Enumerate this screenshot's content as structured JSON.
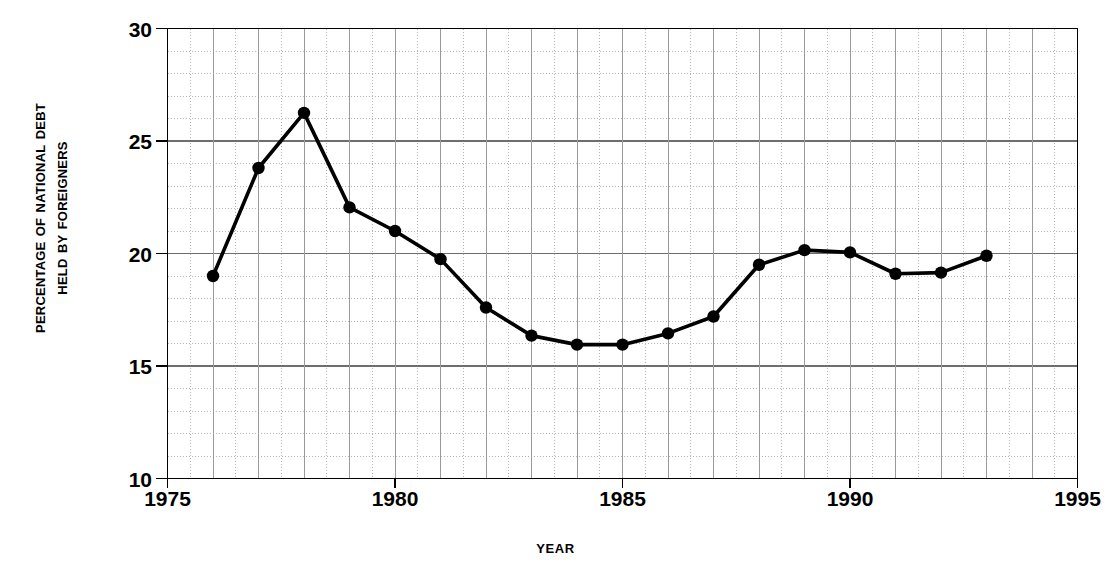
{
  "chart_data": {
    "type": "line",
    "title": "",
    "subtitle": "",
    "xlabel": "Year",
    "ylabel": "Percentage of National Debt Held by Foreigners",
    "ylabel_lines": [
      "Percentage of National Debt",
      "Held by Foreigners"
    ],
    "xlim": [
      1975,
      1995
    ],
    "ylim": [
      10,
      30
    ],
    "xticks": [
      1975,
      1980,
      1985,
      1990,
      1995
    ],
    "xtick_labels": [
      "1975",
      "1980",
      "1985",
      "1990",
      "1995"
    ],
    "yticks": [
      10,
      15,
      20,
      25,
      30
    ],
    "ytick_labels": [
      "10",
      "15",
      "20",
      "25",
      "30"
    ],
    "x_minor_step": 0.5,
    "y_minor_step": 1,
    "grid": true,
    "grid_major_color": "#808080",
    "grid_minor_color": "#b4b4b4",
    "legend": "none",
    "line_color": "#000000",
    "marker_color": "#000000",
    "marker": "circle",
    "x": [
      1976,
      1977,
      1978,
      1979,
      1980,
      1981,
      1982,
      1983,
      1984,
      1985,
      1986,
      1987,
      1988,
      1989,
      1990,
      1991,
      1992,
      1993
    ],
    "values": [
      19.0,
      23.8,
      26.25,
      22.05,
      21.0,
      19.75,
      17.6,
      16.35,
      15.95,
      15.95,
      16.45,
      17.2,
      19.5,
      20.15,
      20.05,
      19.1,
      19.15,
      19.9
    ],
    "series": [
      {
        "name": "Percentage of National Debt Held by Foreigners",
        "values": [
          19.0,
          23.8,
          26.25,
          22.05,
          21.0,
          19.75,
          17.6,
          16.35,
          15.95,
          15.95,
          16.45,
          17.2,
          19.5,
          20.15,
          20.05,
          19.1,
          19.15,
          19.9
        ]
      }
    ]
  }
}
